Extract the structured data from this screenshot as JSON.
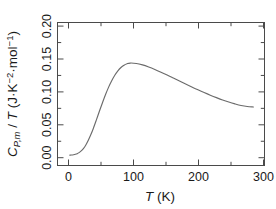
{
  "chart_data": {
    "type": "line",
    "title": "",
    "xlabel": "T (K)",
    "ylabel": "C_{P,m} / T (J·K^-2·mol^-1)",
    "xlim": [
      -18,
      318
    ],
    "ylim": [
      -0.012,
      0.208
    ],
    "grid": false,
    "legend": null,
    "xticks": [
      0,
      100,
      200,
      300
    ],
    "xtick_labels": [
      "0",
      "100",
      "200",
      "300"
    ],
    "x_minor_ticks": [
      50,
      150,
      250
    ],
    "yticks": [
      0.0,
      0.05,
      0.1,
      0.15,
      0.2
    ],
    "ytick_labels": [
      "0.00",
      "0.05",
      "0.10",
      "0.15",
      "0.20"
    ],
    "y_minor_ticks": [
      0.025,
      0.075,
      0.125,
      0.175
    ],
    "series": [
      {
        "name": "Cp,m/T",
        "color": "#6b6b6b",
        "x": [
          2,
          5,
          8,
          11,
          14,
          17,
          20,
          24,
          28,
          32,
          36,
          40,
          45,
          50,
          55,
          60,
          65,
          70,
          75,
          80,
          85,
          90,
          95,
          100,
          110,
          120,
          130,
          140,
          150,
          160,
          170,
          180,
          190,
          200,
          210,
          220,
          230,
          240,
          250,
          260,
          270,
          280,
          290,
          300
        ],
        "y": [
          0.004,
          0.0042,
          0.0046,
          0.0052,
          0.0062,
          0.0078,
          0.01,
          0.014,
          0.0196,
          0.0268,
          0.0352,
          0.0446,
          0.0578,
          0.0714,
          0.0846,
          0.0972,
          0.1086,
          0.1184,
          0.1268,
          0.1336,
          0.1388,
          0.1424,
          0.1446,
          0.1456,
          0.145,
          0.1428,
          0.1396,
          0.1358,
          0.1316,
          0.1272,
          0.1226,
          0.118,
          0.1134,
          0.1088,
          0.1044,
          0.1002,
          0.0962,
          0.0924,
          0.0888,
          0.0856,
          0.0828,
          0.0804,
          0.0788,
          0.078
        ]
      }
    ]
  },
  "axis": {
    "ylabel_parts": {
      "c": "C",
      "c_sub": "P,m",
      "slash": " / ",
      "t": "T",
      "open": " (J·K",
      "k_sup": "−2",
      "mid": "·mol",
      "mol_sup": "−1",
      "close": ")"
    },
    "xlabel_parts": {
      "t": "T",
      "unit": " (K)"
    }
  }
}
